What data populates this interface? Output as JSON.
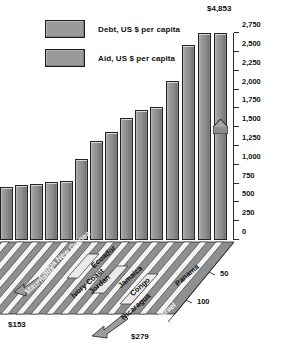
{
  "legend": {
    "items": [
      {
        "label": "Debt, US $  per capita",
        "swatch_color": "#9a9a9a",
        "icon": "square-swatch-icon"
      },
      {
        "label": "Aid, US $ per capita",
        "swatch_color": "#9a9a9a",
        "icon": "square-swatch-icon"
      }
    ]
  },
  "annotations": {
    "top_value": "$4,853",
    "aid_left_value": "$153",
    "aid_right_value": "$279",
    "aid_tick_50": "50",
    "aid_tick_100": "100"
  },
  "axis": {
    "y_ticks": [
      "0",
      "250",
      "500",
      "750",
      "1,000",
      "1,250",
      "1,500",
      "1,750",
      "2,000",
      "2,250",
      "2,500",
      "2,750"
    ]
  },
  "categories_visible": [
    "Mauritania",
    "Papua New Guinea",
    "Ivory Coast",
    "Jordan",
    "Ecuador",
    "Jamaica",
    "Congo",
    "Nicaragua",
    "Panama",
    "Israel"
  ],
  "chart_data": {
    "type": "bar",
    "title": "",
    "subtitle": "",
    "xlabel": "",
    "ylabel": "",
    "ylim": [
      0,
      2750
    ],
    "grid": false,
    "legend_position": "top-left",
    "y_tick_step": 250,
    "y_tick_labels": [
      "0",
      "250",
      "500",
      "750",
      "1,000",
      "1,250",
      "1,500",
      "1,750",
      "2,000",
      "2,250",
      "2,500",
      "2,750"
    ],
    "note": "Debt bars are drawn against the 0-2,750 scale; Israel's debt bar of $4,853 is clipped and shown with an arrowhead. A second diagonal aid scale (ticks 50 and 100) runs along the 3-D floor with arrow markers labelled $153 and $279.",
    "categories": [
      "Mauritania",
      "Papua New Guinea",
      "",
      "Ivory Coast",
      "Jordan",
      "Ecuador",
      "Jamaica",
      "",
      "Congo",
      "Nicaragua",
      "",
      "Panama",
      "",
      "",
      "Israel"
    ],
    "series": [
      {
        "name": "Debt, US $ per capita",
        "values": [
          700,
          730,
          750,
          765,
          780,
          1080,
          1310,
          1430,
          1620,
          1730,
          1770,
          2110,
          2590,
          2790,
          4853
        ]
      },
      {
        "name": "Aid, US $ per capita",
        "axis": "diagonal",
        "labelled_points": [
          {
            "category": "Mauritania",
            "value": 153,
            "label": "$153"
          },
          {
            "category": "Israel",
            "value": 279,
            "label": "$279"
          }
        ],
        "tick_labels": [
          "50",
          "100"
        ]
      }
    ]
  }
}
